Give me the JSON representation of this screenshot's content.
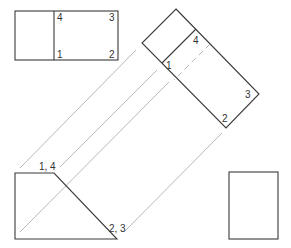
{
  "diagram": {
    "colors": {
      "edge": "#3a3a3a",
      "projection_line": "#b8b8b8",
      "background": "#ffffff",
      "label": "#333333"
    },
    "top_view": {
      "labels": [
        "4",
        "3",
        "1",
        "2"
      ]
    },
    "auxiliary_view": {
      "labels": [
        "4",
        "1",
        "3",
        "2"
      ]
    },
    "front_view": {
      "labels": [
        "1, 4",
        "2, 3"
      ]
    },
    "side_view": {
      "labels": []
    }
  }
}
